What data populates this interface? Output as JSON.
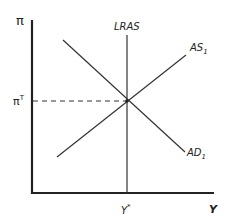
{
  "diagram": {
    "type": "AD-AS model",
    "axes": {
      "y_label": "π",
      "x_label": "Y"
    },
    "curves": [
      {
        "name": "LRAS",
        "label": "LRAS",
        "kind": "vertical"
      },
      {
        "name": "AS",
        "label": "AS",
        "subscript": "1",
        "kind": "upward-sloping"
      },
      {
        "name": "AD",
        "label": "AD",
        "subscript": "1",
        "kind": "downward-sloping"
      }
    ],
    "equilibrium": {
      "y_tick": {
        "base": "π",
        "superscript": "T"
      },
      "x_tick": {
        "base": "Y",
        "superscript": "*"
      }
    },
    "colors": {
      "line": "#333333",
      "axis": "#222222"
    }
  }
}
